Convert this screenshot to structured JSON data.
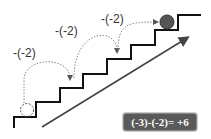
{
  "diagram": {
    "type": "staircase-number-line",
    "steps": [
      {
        "label": "-(-2)"
      },
      {
        "label": "-(-2)"
      },
      {
        "label": "-(-2)"
      }
    ],
    "formula": "(-3)-(-2)= +6",
    "start_marker": "dashed-circle",
    "end_marker": "solid-ball",
    "colors": {
      "stairs": "#111111",
      "arrow": "#444444",
      "dotted_arc": "#888888",
      "ball": "#555555",
      "formula_bg": "#5a5a5a",
      "formula_text": "#ffffff"
    }
  }
}
